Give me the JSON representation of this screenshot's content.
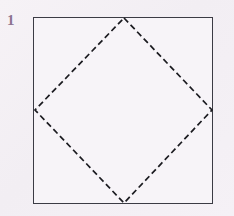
{
  "figure": {
    "label": "1",
    "label_color": "#8d7490",
    "background_color": "#f4f0f5",
    "canvas": {
      "width": 234,
      "height": 216
    },
    "outer_square": {
      "name": "square",
      "stroke_color": "#3b3b44",
      "stroke_width": 1.6,
      "style": "solid",
      "fill": "#f7f4f8",
      "x": 33.5,
      "y": 17.5,
      "width": 179,
      "height": 186
    },
    "inner_diamond": {
      "name": "inscribed-square-rotated-45",
      "stroke_color": "#1b1b20",
      "stroke_width": 1.7,
      "style": "dashed",
      "dash_length": 6,
      "dash_gap": 3.5,
      "fill": "none",
      "vertices": [
        {
          "name": "top-vertex",
          "x": 124,
          "y": 18
        },
        {
          "name": "right-vertex",
          "x": 212,
          "y": 110
        },
        {
          "name": "bottom-vertex",
          "x": 124,
          "y": 203
        },
        {
          "name": "left-vertex",
          "x": 35,
          "y": 110
        }
      ]
    }
  }
}
